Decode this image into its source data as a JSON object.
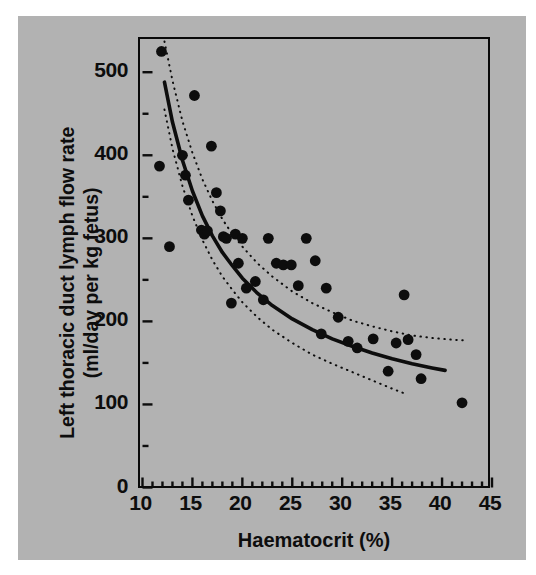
{
  "figure": {
    "background_color": "#b2b2b2",
    "ink_color": "#0d0d0d",
    "page_background": "#ffffff"
  },
  "chart_data": {
    "type": "scatter",
    "title": "",
    "xlabel": "Haematocrit (%)",
    "ylabel_line1": "Left thoracic duct lymph flow rate",
    "ylabel_line2": "(ml/day per kg fetus)",
    "xlim": [
      10,
      45
    ],
    "ylim": [
      0,
      540
    ],
    "xticks": [
      10,
      15,
      20,
      25,
      30,
      35,
      40,
      45
    ],
    "xtick_labels": [
      "10",
      "15",
      "20",
      "25",
      "30",
      "35",
      "40",
      "45"
    ],
    "xticks_minor": [
      11,
      12,
      13,
      14,
      16,
      17,
      18,
      19,
      21,
      22,
      23,
      24,
      26,
      27,
      28,
      29,
      31,
      32,
      33,
      34,
      36,
      37,
      38,
      39,
      41,
      42,
      43,
      44
    ],
    "yticks": [
      0,
      100,
      200,
      300,
      400,
      500
    ],
    "ytick_labels": [
      "0",
      "100",
      "200",
      "300",
      "400",
      "500"
    ],
    "yticks_minor": [
      50,
      150,
      250,
      350,
      450
    ],
    "grid": false,
    "legend": false,
    "marker": "filled-circle",
    "marker_color": "#0d0d0d",
    "x": [
      11.9,
      11.7,
      12.7,
      14.0,
      14.3,
      14.6,
      15.2,
      15.9,
      16.2,
      16.5,
      16.9,
      17.4,
      17.8,
      18.1,
      18.4,
      18.9,
      19.3,
      19.6,
      20.0,
      20.4,
      21.3,
      22.1,
      22.6,
      23.4,
      24.1,
      24.9,
      25.6,
      26.4,
      27.3,
      27.9,
      28.4,
      29.6,
      30.6,
      31.5,
      33.1,
      34.6,
      35.4,
      36.2,
      36.6,
      37.4,
      37.9,
      42.0
    ],
    "y": [
      525,
      387,
      290,
      400,
      376,
      346,
      472,
      310,
      305,
      309,
      411,
      355,
      333,
      302,
      300,
      222,
      305,
      270,
      300,
      240,
      248,
      226,
      300,
      270,
      268,
      268,
      243,
      300,
      273,
      185,
      240,
      205,
      176,
      168,
      179,
      140,
      174,
      232,
      178,
      160,
      131,
      102
    ],
    "fit_curve": {
      "name": "fitted regression curve",
      "style": "solid",
      "color": "#0d0d0d",
      "x": [
        12.2,
        13.0,
        14.0,
        15.0,
        16.0,
        17.0,
        18.0,
        19.0,
        20.0,
        21.5,
        23.0,
        25.0,
        27.0,
        29.0,
        31.0,
        33.0,
        35.0,
        37.0,
        39.0,
        40.3
      ],
      "y": [
        488,
        440,
        394,
        357,
        327,
        303,
        283,
        267,
        252,
        234,
        219,
        203,
        190,
        179,
        170,
        162,
        155,
        149,
        144,
        141
      ]
    },
    "confidence_bands": [
      {
        "name": "upper confidence band",
        "style": "dotted",
        "color": "#0d0d0d",
        "x": [
          12.2,
          13.0,
          14.0,
          15.0,
          16.0,
          17.0,
          18.0,
          19.0,
          20.0,
          21.5,
          23.0,
          25.0,
          27.0,
          29.0,
          31.0,
          33.0,
          35.0,
          37.0,
          39.0,
          41.0,
          42.5
        ],
        "y": [
          537,
          490,
          441,
          403,
          371,
          345,
          323,
          305,
          290,
          270,
          254,
          236,
          222,
          211,
          201,
          194,
          188,
          183,
          180,
          178,
          177
        ]
      },
      {
        "name": "lower confidence band",
        "style": "dotted",
        "color": "#0d0d0d",
        "x": [
          12.2,
          13.0,
          14.0,
          15.0,
          16.0,
          17.0,
          18.0,
          19.0,
          20.0,
          21.5,
          23.0,
          25.0,
          27.0,
          29.0,
          31.0,
          33.0,
          35.0,
          36.5
        ],
        "y": [
          455,
          408,
          363,
          327,
          298,
          274,
          254,
          238,
          223,
          205,
          190,
          174,
          160,
          149,
          139,
          129,
          119,
          112
        ]
      }
    ]
  }
}
